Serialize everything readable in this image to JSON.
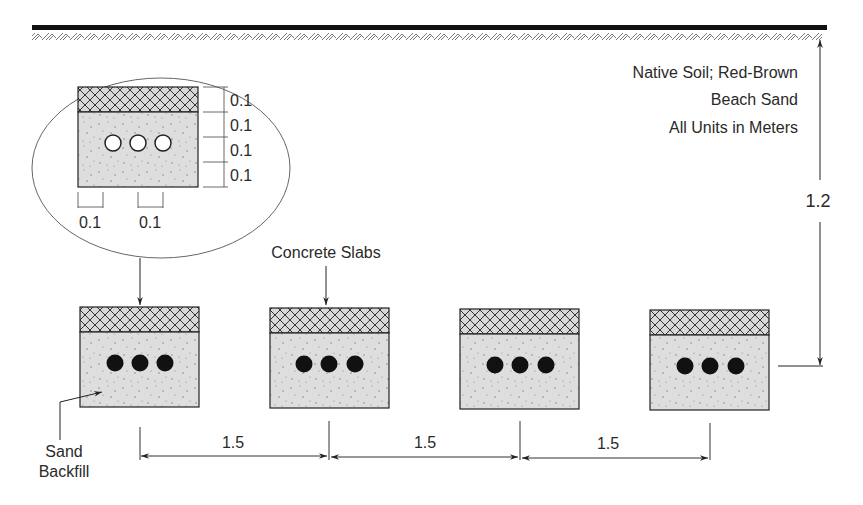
{
  "diagram": {
    "notes": {
      "line1": "Native Soil; Red-Brown",
      "line2": "Beach Sand",
      "line3": "All Units in Meters"
    },
    "depth_label": "1.2",
    "slab_label": "Concrete Slabs",
    "backfill_label": {
      "line1": "Sand",
      "line2": "Backfill"
    },
    "spacing_labels": [
      "1.5",
      "1.5",
      "1.5"
    ],
    "detail": {
      "vertical_dims": [
        "0.1",
        "0.1",
        "0.1",
        "0.1"
      ],
      "horizontal_dims": [
        "0.1",
        "0.1"
      ]
    },
    "colors": {
      "line": "#222222",
      "backfill": "#dcdcdc",
      "slab": "#d8d8d8",
      "cable": "#111111"
    }
  }
}
